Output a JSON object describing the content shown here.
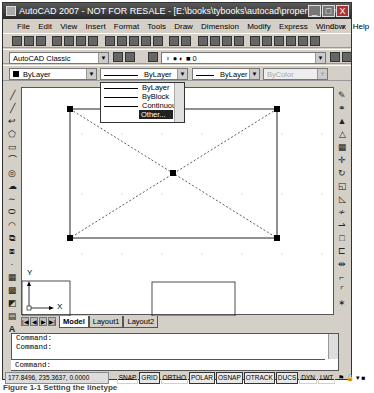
{
  "window": {
    "title": "AutoCAD 2007 - NOT FOR RESALE - [E:\\books\\tybooks\\autocad\\properties.dwg]",
    "controls": [
      "_",
      "□",
      "X"
    ]
  },
  "menubar": {
    "items": [
      "File",
      "Edit",
      "View",
      "Insert",
      "Format",
      "Tools",
      "Draw",
      "Dimension",
      "Modify",
      "Express",
      "Window",
      "Help"
    ],
    "doc_controls": [
      "_",
      "□",
      "x"
    ]
  },
  "workspace": {
    "selected": "AutoCAD Classic"
  },
  "layer": {
    "current": "0"
  },
  "properties": {
    "color": "ByLayer",
    "linetype": "ByLayer",
    "lineweight": "ByLayer",
    "plotstyle": "ByColor"
  },
  "linetype_dropdown": {
    "options": [
      "ByLayer",
      "ByBlock",
      "Continuous",
      "Other..."
    ],
    "highlighted": "Other..."
  },
  "layout_tabs": {
    "nav": [
      "|◀",
      "◀",
      "▶",
      "▶|"
    ],
    "tabs": [
      "Model",
      "Layout1",
      "Layout2"
    ],
    "active": "Model"
  },
  "ucs": {
    "x_label": "X",
    "y_label": "Y"
  },
  "command_window": {
    "history": [
      "Command:",
      "Command:"
    ],
    "prompt": "Command:"
  },
  "statusbar": {
    "coordinates": "177.8496, 235.3637, 0.0000",
    "toggles": [
      {
        "label": "SNAP",
        "on": false
      },
      {
        "label": "GRID",
        "on": true
      },
      {
        "label": "ORTHO",
        "on": false
      },
      {
        "label": "POLAR",
        "on": true
      },
      {
        "label": "OSNAP",
        "on": true
      },
      {
        "label": "OTRACK",
        "on": true
      },
      {
        "label": "DUCS",
        "on": true
      },
      {
        "label": "DYN",
        "on": false
      },
      {
        "label": "LWT",
        "on": false
      }
    ]
  },
  "caption": "Figure 1-1  Setting the linetype"
}
